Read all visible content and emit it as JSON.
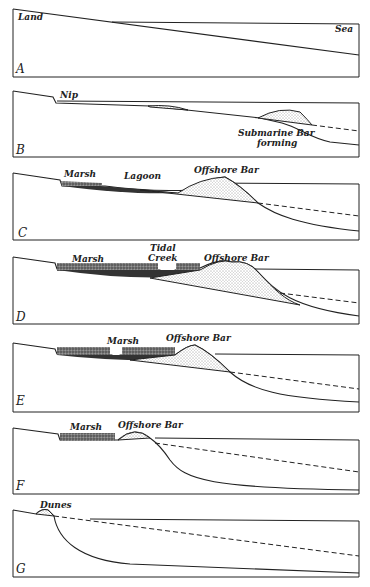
{
  "figure": {
    "panels": [
      {
        "id": "A",
        "letter": "A",
        "labels": {
          "land": "Land",
          "sea": "Sea"
        }
      },
      {
        "id": "B",
        "letter": "B",
        "labels": {
          "nip": "Nip",
          "bar_line1": "Submarine Bar",
          "bar_line2": "forming"
        }
      },
      {
        "id": "C",
        "letter": "C",
        "labels": {
          "marsh": "Marsh",
          "lagoon": "Lagoon",
          "bar": "Offshore Bar"
        }
      },
      {
        "id": "D",
        "letter": "D",
        "labels": {
          "marsh": "Marsh",
          "creek_line1": "Tidal",
          "creek_line2": "Creek",
          "bar": "Offshore Bar"
        }
      },
      {
        "id": "E",
        "letter": "E",
        "labels": {
          "marsh": "Marsh",
          "bar": "Offshore Bar"
        }
      },
      {
        "id": "F",
        "letter": "F",
        "labels": {
          "marsh": "Marsh",
          "bar": "Offshore Bar"
        }
      },
      {
        "id": "G",
        "letter": "G",
        "labels": {
          "dunes": "Dunes"
        }
      }
    ]
  },
  "colors": {
    "ink": "#222222",
    "paper": "#ffffff",
    "marsh": "#555555"
  }
}
